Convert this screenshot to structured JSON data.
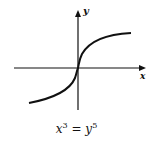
{
  "figure": {
    "x_axis_label": "x",
    "y_axis_label": "y",
    "equation": {
      "lhs_base": "x",
      "lhs_exp": "3",
      "op": " = ",
      "rhs_base": "y",
      "rhs_exp": "5"
    },
    "curve": "x^3 = y^5",
    "colors": {
      "stroke": "#111111",
      "background": "#ffffff"
    }
  }
}
